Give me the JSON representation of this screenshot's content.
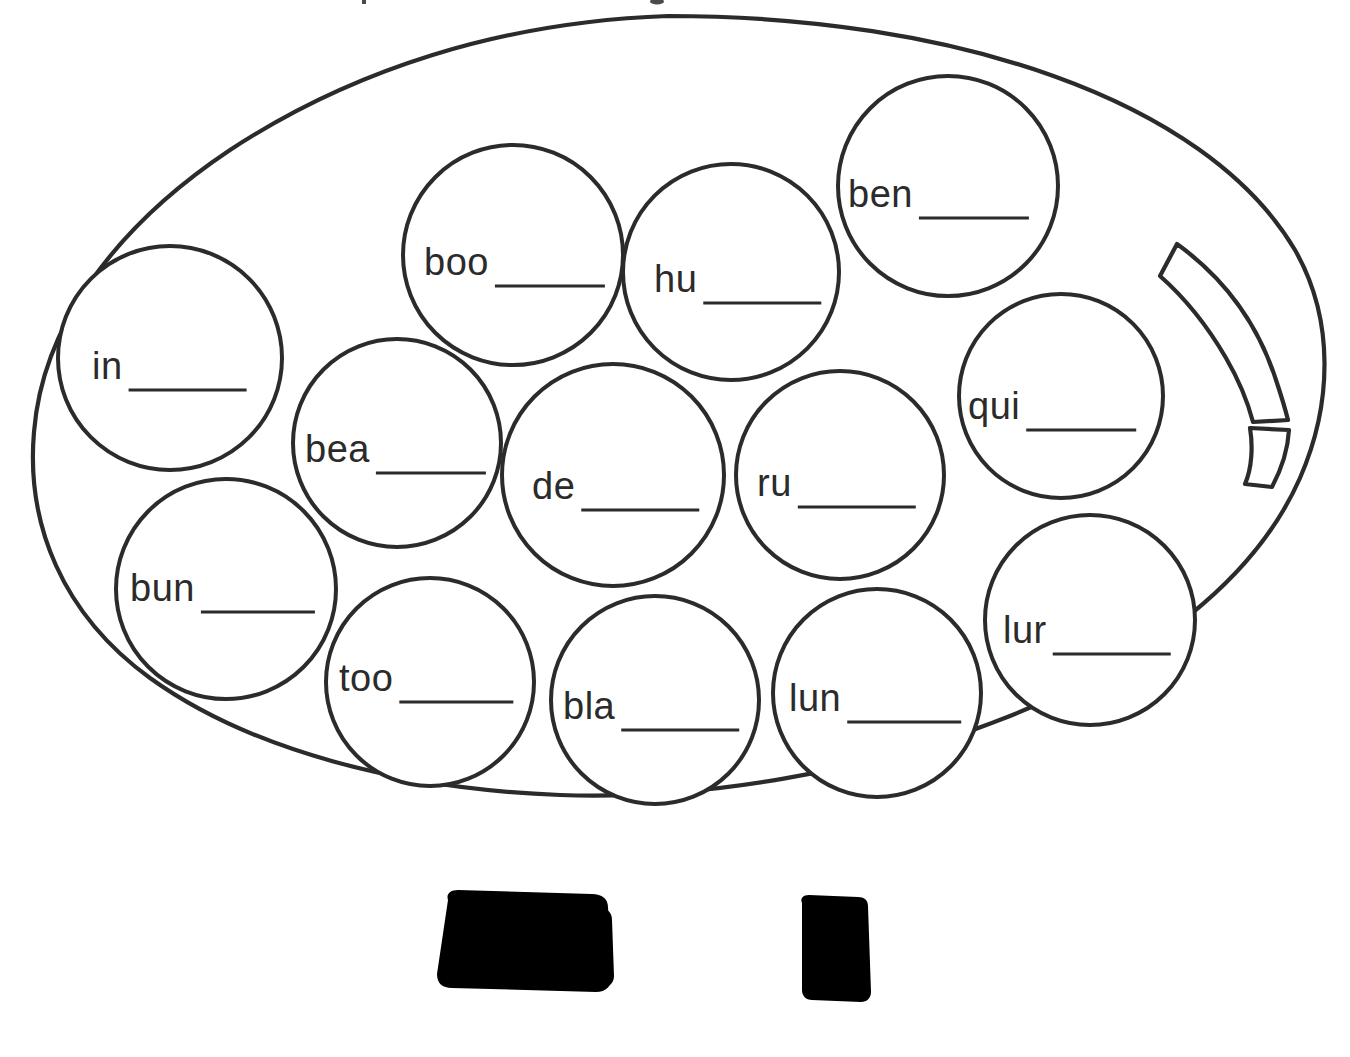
{
  "page": {
    "background_color": "#ffffff",
    "ink_color": "#2b2b2b",
    "width": 1350,
    "height": 1057
  },
  "machine": {
    "name": "gumball-machine",
    "globe_label": "gumball-globe",
    "parts": [
      {
        "name": "globe",
        "label": "globe"
      },
      {
        "name": "collar",
        "label": "collar"
      },
      {
        "name": "base",
        "label": "base"
      },
      {
        "name": "dispenser-tray",
        "label": "dispenser tray"
      },
      {
        "name": "coin-slot",
        "label": "coin slot"
      },
      {
        "name": "turn-knob",
        "label": "turn knob"
      },
      {
        "name": "globe-arc-slot",
        "label": "arc slot"
      }
    ]
  },
  "gumballs": [
    {
      "id": "in",
      "prefix": "in",
      "blank": "_____",
      "cx": 170,
      "cy": 358,
      "r": 112,
      "tx": 92,
      "ty": 379,
      "bw": 118
    },
    {
      "id": "boo",
      "prefix": "boo",
      "blank": "_____",
      "cx": 513,
      "cy": 255,
      "r": 110,
      "tx": 424,
      "ty": 275,
      "bw": 110
    },
    {
      "id": "hu",
      "prefix": "hu",
      "blank": "_____",
      "cx": 731,
      "cy": 272,
      "r": 108,
      "tx": 654,
      "ty": 292,
      "bw": 118
    },
    {
      "id": "ben",
      "prefix": "ben",
      "blank": "_____",
      "cx": 948,
      "cy": 186,
      "r": 110,
      "tx": 848,
      "ty": 207,
      "bw": 110
    },
    {
      "id": "bea",
      "prefix": "bea",
      "blank": "_____",
      "cx": 397,
      "cy": 443,
      "r": 104,
      "tx": 305,
      "ty": 462,
      "bw": 110
    },
    {
      "id": "de",
      "prefix": "de",
      "blank": "_____",
      "cx": 613,
      "cy": 475,
      "r": 111,
      "tx": 532,
      "ty": 499,
      "bw": 118
    },
    {
      "id": "ru",
      "prefix": "ru",
      "blank": "_____",
      "cx": 840,
      "cy": 475,
      "r": 104,
      "tx": 757,
      "ty": 496,
      "bw": 118
    },
    {
      "id": "qui",
      "prefix": "qui",
      "blank": "_____",
      "cx": 1061,
      "cy": 396,
      "r": 102,
      "tx": 968,
      "ty": 419,
      "bw": 110
    },
    {
      "id": "bun",
      "prefix": "bun",
      "blank": "_____",
      "cx": 226,
      "cy": 589,
      "r": 110,
      "tx": 130,
      "ty": 601,
      "bw": 114
    },
    {
      "id": "too",
      "prefix": "too",
      "blank": "_____",
      "cx": 430,
      "cy": 682,
      "r": 104,
      "tx": 339,
      "ty": 691,
      "bw": 114
    },
    {
      "id": "bla",
      "prefix": "bla",
      "blank": "_____",
      "cx": 655,
      "cy": 700,
      "r": 104,
      "tx": 563,
      "ty": 719,
      "bw": 118
    },
    {
      "id": "lun",
      "prefix": "lun",
      "blank": "_____",
      "cx": 877,
      "cy": 693,
      "r": 104,
      "tx": 789,
      "ty": 711,
      "bw": 114
    },
    {
      "id": "lur",
      "prefix": "lur",
      "blank": "_____",
      "cx": 1090,
      "cy": 620,
      "r": 105,
      "tx": 1003,
      "ty": 643,
      "bw": 118
    }
  ]
}
